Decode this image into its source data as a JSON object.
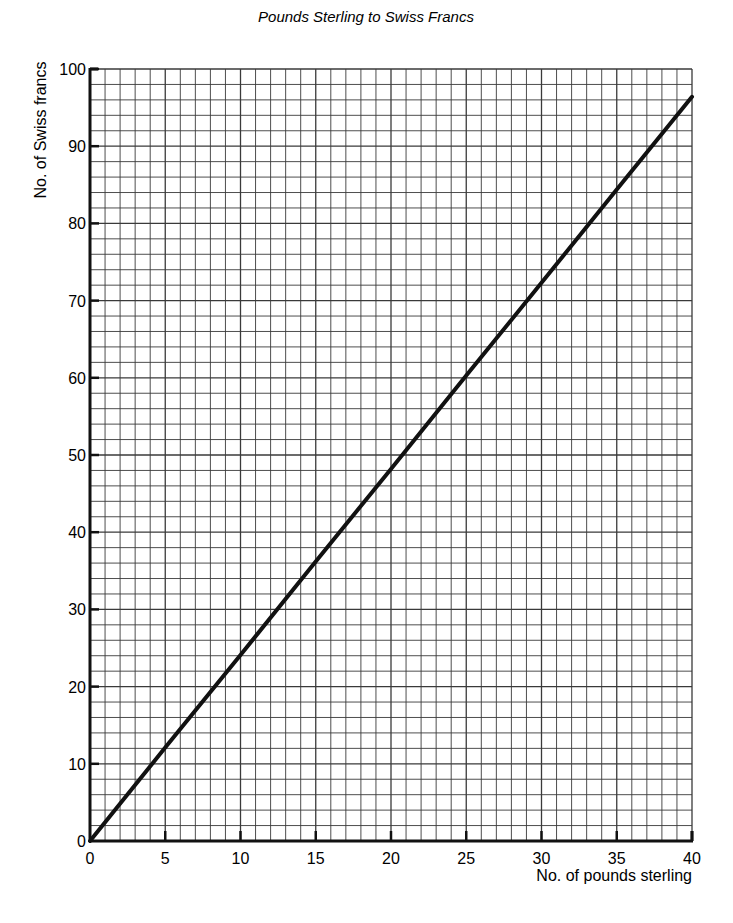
{
  "chart_data": {
    "type": "line",
    "title": "Pounds Sterling to Swiss Francs",
    "xlabel": "No. of pounds sterling",
    "ylabel": "No. of Swiss francs",
    "xlim": [
      0,
      40
    ],
    "ylim": [
      0,
      100
    ],
    "x_ticks": [
      0,
      5,
      10,
      15,
      20,
      25,
      30,
      35,
      40
    ],
    "y_ticks": [
      0,
      10,
      20,
      30,
      40,
      50,
      60,
      70,
      80,
      90,
      100
    ],
    "grid": true,
    "grid_minor_x_step": 1,
    "grid_minor_y_step": 2,
    "legend": null,
    "series": [
      {
        "name": "Swiss francs",
        "x": [
          0,
          5,
          10,
          15,
          20,
          25,
          30,
          35,
          40
        ],
        "values": [
          0,
          12.1,
          24.1,
          36.2,
          48.2,
          60.3,
          72.3,
          84.4,
          96.4
        ]
      }
    ],
    "annotations": []
  },
  "colors": {
    "line": "#111111",
    "grid": "#3a3a3a",
    "axis": "#111111",
    "background": "#ffffff"
  }
}
